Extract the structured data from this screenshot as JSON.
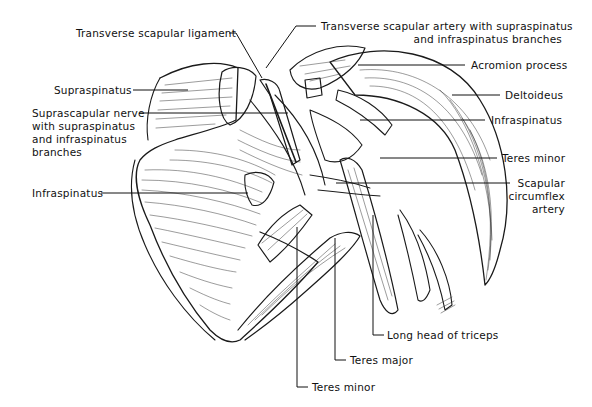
{
  "figure": {
    "colors": {
      "ink": "#1a1a1a",
      "background": "#ffffff"
    },
    "labels": {
      "transverse_scapular_ligament": "Transverse scapular ligament",
      "transverse_scapular_artery_line1": "Transverse scapular artery with supraspinatus",
      "transverse_scapular_artery_line2": "and infraspinatus branches",
      "supraspinatus": "Supraspinatus",
      "suprascapular_nerve_line1": "Suprascapular nerve",
      "suprascapular_nerve_line2": "with supraspinatus",
      "suprascapular_nerve_line3": "and infraspinatus",
      "suprascapular_nerve_line4": "branches",
      "infraspinatus_left": "Infraspinatus",
      "acromion_process": "Acromion process",
      "deltoideus": "Deltoideus",
      "infraspinatus_right": "Infraspinatus",
      "teres_minor_right": "Teres minor",
      "scapular_circumflex_line1": "Scapular",
      "scapular_circumflex_line2": "circumflex",
      "scapular_circumflex_line3": "artery",
      "long_head_triceps": "Long head of triceps",
      "teres_major": "Teres major",
      "teres_minor_bottom": "Teres minor"
    }
  }
}
